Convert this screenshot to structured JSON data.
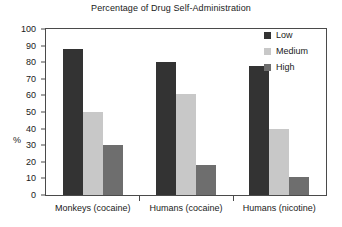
{
  "chart_data": {
    "type": "bar",
    "title": "Percentage of Drug Self-Administration",
    "xlabel": "",
    "ylabel": "%",
    "categories": [
      "Monkeys (cocaine)",
      "Humans (cocaine)",
      "Humans (nicotine)"
    ],
    "series": [
      {
        "name": "Low",
        "color": "#333333",
        "values": [
          88,
          80,
          78
        ]
      },
      {
        "name": "Medium",
        "color": "#c8c8c8",
        "values": [
          50,
          61,
          40
        ]
      },
      {
        "name": "High",
        "color": "#6e6e6e",
        "values": [
          30,
          18,
          11
        ]
      }
    ],
    "ylim": [
      0,
      100
    ],
    "yticks": [
      100,
      90,
      80,
      70,
      60,
      50,
      40,
      30,
      20,
      10,
      0
    ],
    "grid": false,
    "legend_position": "top-right"
  },
  "legend": {
    "items": [
      {
        "label": "Low",
        "color": "#333333"
      },
      {
        "label": "Medium",
        "color": "#c8c8c8"
      },
      {
        "label": "High",
        "color": "#6e6e6e"
      }
    ]
  }
}
